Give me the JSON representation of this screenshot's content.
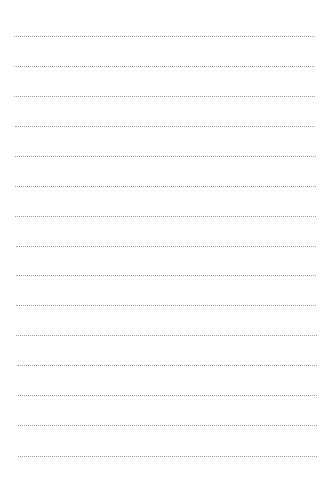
{
  "sheet": {
    "type": "lined-paper",
    "background": "#ffffff",
    "line_style": "dotted",
    "line_color": "#a3a3a3",
    "lines": [
      {
        "y": 36,
        "x1": 14,
        "x2": 315
      },
      {
        "y": 66,
        "x1": 14,
        "x2": 315
      },
      {
        "y": 96,
        "x1": 14,
        "x2": 315
      },
      {
        "y": 126,
        "x1": 15,
        "x2": 315
      },
      {
        "y": 156,
        "x1": 15,
        "x2": 316
      },
      {
        "y": 186,
        "x1": 15,
        "x2": 316
      },
      {
        "y": 216,
        "x1": 15,
        "x2": 316
      },
      {
        "y": 246,
        "x1": 16,
        "x2": 316
      },
      {
        "y": 275,
        "x1": 16,
        "x2": 316
      },
      {
        "y": 305,
        "x1": 16,
        "x2": 316
      },
      {
        "y": 335,
        "x1": 16,
        "x2": 317
      },
      {
        "y": 365,
        "x1": 17,
        "x2": 317
      },
      {
        "y": 395,
        "x1": 18,
        "x2": 317
      },
      {
        "y": 425,
        "x1": 18,
        "x2": 317
      },
      {
        "y": 456,
        "x1": 18,
        "x2": 317
      }
    ]
  }
}
